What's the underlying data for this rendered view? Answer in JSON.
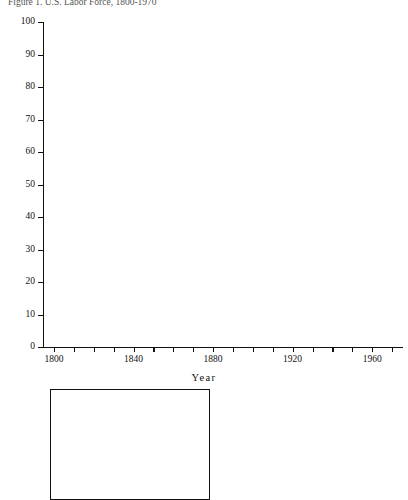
{
  "figure": {
    "title": "Figure 1.  U.S. Labor Force, 1800-1970"
  },
  "chart_data": {
    "type": "bar",
    "subtype": "stacked-percent-bar",
    "xlabel": "Year",
    "ylabel": "Percent",
    "ylim": [
      0,
      100
    ],
    "ytick_values": [
      0,
      10,
      20,
      30,
      40,
      50,
      60,
      70,
      80,
      90,
      100
    ],
    "ytick_labels": [
      "0",
      "10",
      "20",
      "30",
      "40",
      "50",
      "60",
      "70",
      "80",
      "90",
      "100"
    ],
    "xtick_values": [
      1800,
      1840,
      1880,
      1920,
      1960
    ],
    "xtick_labels": [
      "1800",
      "1840",
      "1880",
      "1920",
      "1960"
    ],
    "grid": false,
    "legend_position": "below-left",
    "categories": [
      1800,
      1810,
      1820,
      1830,
      1840,
      1850,
      1860,
      1870,
      1880,
      1890,
      1900,
      1910,
      1920,
      1930,
      1940,
      1950,
      1960,
      1970
    ],
    "stack_order": [
      "Information",
      "Agriculture",
      "Industry",
      "Services"
    ],
    "series": [
      {
        "name": "Information",
        "key": "information",
        "pattern": "cross-hatch",
        "values": [
          0,
          0,
          0,
          0,
          0,
          4.5,
          5.0,
          6.0,
          7.0,
          12.5,
          13.0,
          15.0,
          17.5,
          22.5,
          23.0,
          29.0,
          40.0,
          46.0
        ]
      },
      {
        "name": "Agriculture",
        "key": "agriculture",
        "pattern": "solid-white",
        "values": [
          87.5,
          81.0,
          72.0,
          69.5,
          62.5,
          54.0,
          47.5,
          45.0,
          43.5,
          37.0,
          35.0,
          29.0,
          23.5,
          17.0,
          14.5,
          10.0,
          5.5,
          2.5
        ]
      },
      {
        "name": "Industry",
        "key": "industry",
        "pattern": "horizontal-lines",
        "values": [
          1.5,
          7.0,
          11.5,
          12.5,
          17.0,
          21.5,
          25.5,
          24.0,
          26.5,
          28.0,
          28.0,
          31.0,
          32.5,
          29.5,
          32.5,
          33.5,
          27.0,
          23.5
        ]
      },
      {
        "name": "Services (Other Than Information)",
        "key": "services",
        "pattern": "vertical-lines",
        "values": [
          11.0,
          12.0,
          16.5,
          18.0,
          20.5,
          20.0,
          22.0,
          25.0,
          23.0,
          22.5,
          24.0,
          25.0,
          26.5,
          31.0,
          30.0,
          27.5,
          27.5,
          28.0
        ]
      }
    ]
  },
  "legend": {
    "items": [
      {
        "key": "services",
        "label": "Services\n(Other Than\nInformation)"
      },
      {
        "key": "industry",
        "label": "Industry"
      },
      {
        "key": "agriculture",
        "label": "Agriculture"
      },
      {
        "key": "information",
        "label": "Information"
      }
    ]
  },
  "colors": {
    "ink": "#111111",
    "paper": "#ffffff"
  }
}
